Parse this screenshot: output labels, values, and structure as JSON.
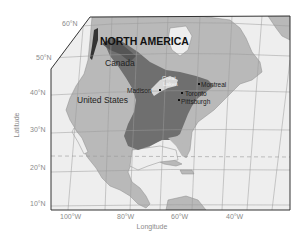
{
  "map": {
    "title": "NORTH AMERICA",
    "colors": {
      "ocean": "#eeeeee",
      "land": "#b9b9b9",
      "shaded_region": "#6f6f6f",
      "shaded_dark": "#555555",
      "grid": "#9a9a9a",
      "border": "#333333",
      "tropic_line": "#999999"
    },
    "axes": {
      "x_label": "Longitude",
      "y_label": "Latitude",
      "x_ticks": [
        "100°W",
        "80°W",
        "60°W",
        "40°W"
      ],
      "y_ticks": [
        "60°N",
        "50°N",
        "40°N",
        "30°N",
        "20°N",
        "10°N"
      ]
    },
    "regions": {
      "canada": "Canada",
      "united_states": "United States"
    },
    "places": [
      {
        "name": "Madison",
        "type": "city"
      },
      {
        "name": "Great Lakes",
        "type": "lakes",
        "line1": "Great",
        "line2": "Lakes"
      },
      {
        "name": "Montreal",
        "type": "city"
      },
      {
        "name": "Toronto",
        "type": "city"
      },
      {
        "name": "Pittsburgh",
        "type": "city"
      }
    ]
  }
}
